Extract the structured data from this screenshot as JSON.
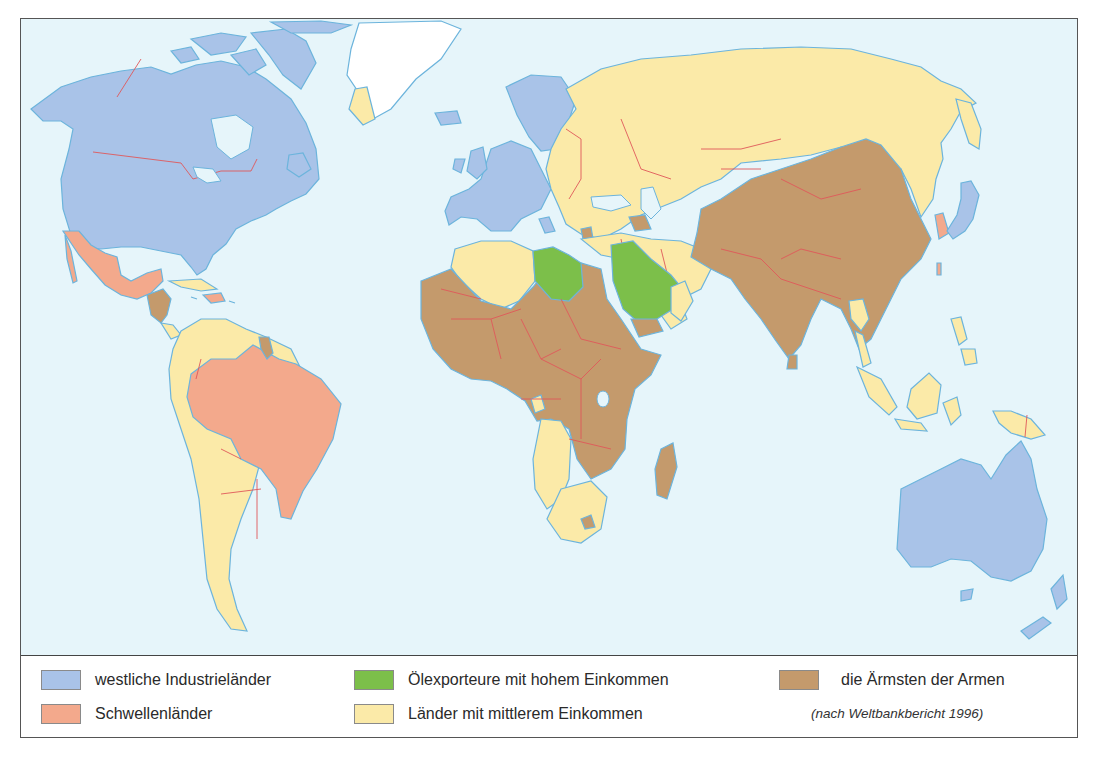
{
  "map": {
    "title": "",
    "background_color": "#e6f5fa",
    "colors": {
      "western_industrial": "#a9c3e8",
      "emerging": "#f3a98c",
      "oil_exporters": "#7cbf4a",
      "middle_income": "#fbeaa8",
      "poorest": "#c49a6c",
      "border_coast": "#6cb4dc",
      "border_country": "#e0585a",
      "greenland": "#ffffff"
    },
    "regions": [
      {
        "name": "North America (USA, Canada)",
        "category": "western_industrial"
      },
      {
        "name": "Western Europe",
        "category": "western_industrial"
      },
      {
        "name": "Japan",
        "category": "western_industrial"
      },
      {
        "name": "Australia",
        "category": "western_industrial"
      },
      {
        "name": "New Zealand",
        "category": "western_industrial"
      },
      {
        "name": "Mexico",
        "category": "emerging"
      },
      {
        "name": "Brazil",
        "category": "emerging"
      },
      {
        "name": "South Korea",
        "category": "emerging"
      },
      {
        "name": "Taiwan",
        "category": "emerging"
      },
      {
        "name": "Libya",
        "category": "oil_exporters"
      },
      {
        "name": "Saudi Arabia",
        "category": "oil_exporters"
      },
      {
        "name": "Russia / Eastern Europe / Central Asia",
        "category": "middle_income"
      },
      {
        "name": "South America (excl. Brazil)",
        "category": "middle_income"
      },
      {
        "name": "North Africa (Algeria, Morocco, Tunisia)",
        "category": "middle_income"
      },
      {
        "name": "Southern Africa",
        "category": "middle_income"
      },
      {
        "name": "Southeast Asia (Thailand, Malaysia, Indonesia)",
        "category": "middle_income"
      },
      {
        "name": "China",
        "category": "poorest"
      },
      {
        "name": "India / South Asia",
        "category": "poorest"
      },
      {
        "name": "Sub-Saharan Africa",
        "category": "poorest"
      },
      {
        "name": "Central America (parts)",
        "category": "poorest"
      },
      {
        "name": "Guyana",
        "category": "poorest"
      },
      {
        "name": "Yemen",
        "category": "poorest"
      },
      {
        "name": "Madagascar",
        "category": "poorest"
      }
    ]
  },
  "legend": {
    "items": [
      {
        "key": "western_industrial",
        "label": "westliche Industrieländer",
        "color": "#a9c3e8"
      },
      {
        "key": "emerging",
        "label": "Schwellenländer",
        "color": "#f3a98c"
      },
      {
        "key": "oil_exporters",
        "label": "Ölexporteure mit hohem Einkommen",
        "color": "#7cbf4a"
      },
      {
        "key": "middle_income",
        "label": "Länder mit mittlerem Einkommen",
        "color": "#fbeaa8"
      },
      {
        "key": "poorest",
        "label": "die Ärmsten der Armen",
        "color": "#c49a6c"
      }
    ],
    "source": "(nach Weltbankbericht 1996)"
  }
}
